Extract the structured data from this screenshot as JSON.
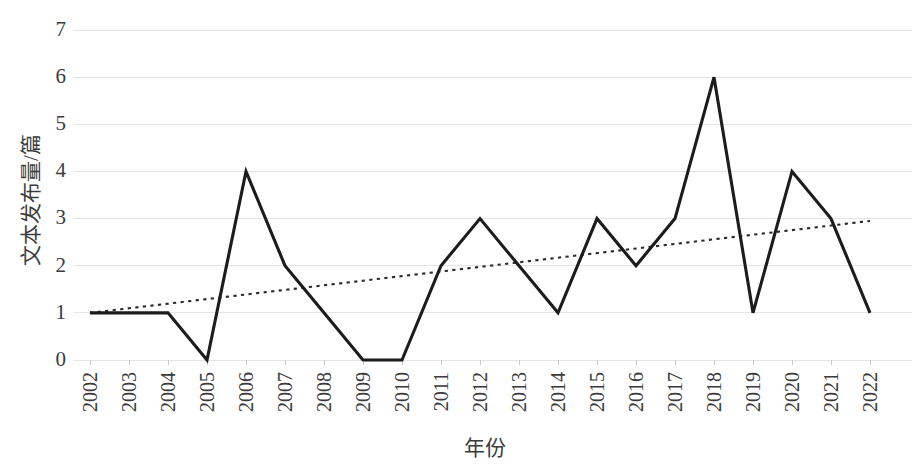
{
  "chart_data": {
    "type": "line",
    "title": "",
    "xlabel": "年份",
    "ylabel": "文本发布量/篇",
    "categories": [
      "2002",
      "2003",
      "2004",
      "2005",
      "2006",
      "2007",
      "2008",
      "2009",
      "2010",
      "2011",
      "2012",
      "2013",
      "2014",
      "2015",
      "2016",
      "2017",
      "2018",
      "2019",
      "2020",
      "2021",
      "2022"
    ],
    "ylim": [
      0,
      7
    ],
    "yticks": [
      0,
      1,
      2,
      3,
      4,
      5,
      6,
      7
    ],
    "ytick_labels": [
      "0",
      "1",
      "2",
      "3",
      "4",
      "5",
      "6",
      "7"
    ],
    "grid": true,
    "legend": "none",
    "series": [
      {
        "name": "文本发布量",
        "style": "solid",
        "color": "#1c1c1c",
        "values": [
          1,
          1,
          1,
          0,
          4,
          2,
          1,
          0,
          0,
          2,
          3,
          2,
          1,
          3,
          2,
          3,
          6,
          1,
          4,
          3,
          1
        ]
      },
      {
        "name": "线性趋势线",
        "style": "dotted",
        "color": "#2a2a2a",
        "endpoints": [
          {
            "x": "2002",
            "y": 1.0
          },
          {
            "x": "2022",
            "y": 2.95
          }
        ]
      }
    ]
  },
  "axes": {
    "y_label_text": "文本发布量/篇",
    "x_label_text": "年份",
    "y_tick_0": "0",
    "y_tick_1": "1",
    "y_tick_2": "2",
    "y_tick_3": "3",
    "y_tick_4": "4",
    "y_tick_5": "5",
    "y_tick_6": "6",
    "y_tick_7": "7"
  },
  "colors": {
    "background": "#ffffff",
    "grid": "#e4e4e4",
    "data_line": "#1c1c1c",
    "trend_line": "#2a2a2a",
    "text": "#3b3b3b"
  }
}
